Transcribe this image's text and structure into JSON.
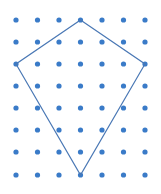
{
  "diagram": {
    "type": "dot-grid-polygon",
    "colors": {
      "dot": "#3a7bc8",
      "line": "#4a78b5",
      "background": "#ffffff"
    },
    "grid": {
      "columns": 7,
      "rows": 8,
      "x_positions": [
        16,
        37.5,
        59,
        80.5,
        102,
        123.5,
        145
      ],
      "y_positions": [
        20,
        42,
        64,
        86,
        108,
        130,
        152,
        175
      ],
      "dot_radius": 2.6
    },
    "polygon": {
      "shape": "kite",
      "vertices_grid": [
        [
          3,
          0
        ],
        [
          6,
          2
        ],
        [
          3,
          7
        ],
        [
          0,
          2
        ]
      ]
    }
  }
}
